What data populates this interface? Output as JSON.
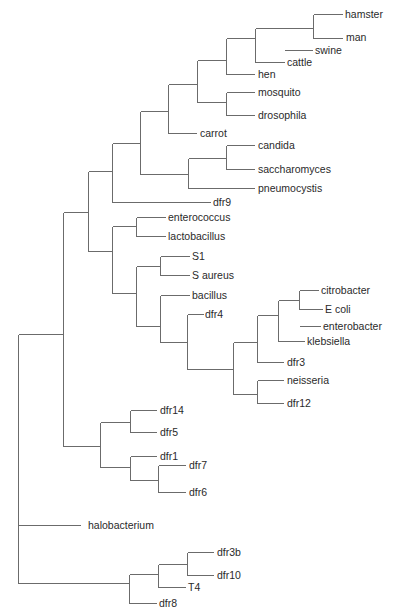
{
  "diagram": {
    "type": "phylogenetic-tree",
    "root_x": 18,
    "branches": [
      {
        "x": 18,
        "y1": 334,
        "y2": 490
      },
      {
        "x": 18,
        "y1": 490,
        "y2": 583
      },
      {
        "x": 63,
        "y1": 212,
        "y2": 446
      },
      {
        "x": 88,
        "y1": 171,
        "y2": 251
      },
      {
        "x": 112,
        "y1": 143,
        "y2": 202
      },
      {
        "x": 140,
        "y1": 111,
        "y2": 174
      },
      {
        "x": 168,
        "y1": 84,
        "y2": 133
      },
      {
        "x": 197,
        "y1": 60,
        "y2": 102
      },
      {
        "x": 226,
        "y1": 38,
        "y2": 74
      },
      {
        "x": 255,
        "y1": 28,
        "y2": 62
      },
      {
        "x": 313,
        "y1": 14,
        "y2": 38
      },
      {
        "x": 226,
        "y1": 92,
        "y2": 115
      },
      {
        "x": 188,
        "y1": 158,
        "y2": 188
      },
      {
        "x": 226,
        "y1": 145,
        "y2": 169
      },
      {
        "x": 112,
        "y1": 226,
        "y2": 293
      },
      {
        "x": 136,
        "y1": 217,
        "y2": 236
      },
      {
        "x": 136,
        "y1": 266,
        "y2": 326
      },
      {
        "x": 160,
        "y1": 256,
        "y2": 275
      },
      {
        "x": 160,
        "y1": 295,
        "y2": 342
      },
      {
        "x": 187,
        "y1": 314,
        "y2": 369
      },
      {
        "x": 233,
        "y1": 342,
        "y2": 394
      },
      {
        "x": 257,
        "y1": 315,
        "y2": 362
      },
      {
        "x": 278,
        "y1": 300,
        "y2": 341
      },
      {
        "x": 299,
        "y1": 290,
        "y2": 309
      },
      {
        "x": 257,
        "y1": 380,
        "y2": 403
      },
      {
        "x": 100,
        "y1": 422,
        "y2": 467
      },
      {
        "x": 130,
        "y1": 410,
        "y2": 432
      },
      {
        "x": 130,
        "y1": 456,
        "y2": 480
      },
      {
        "x": 158,
        "y1": 465,
        "y2": 492
      },
      {
        "x": 129,
        "y1": 574,
        "y2": 603
      },
      {
        "x": 158,
        "y1": 564,
        "y2": 587
      },
      {
        "x": 187,
        "y1": 552,
        "y2": 575
      }
    ],
    "horizontals": [
      {
        "y": 334,
        "x1": 18,
        "x2": 63
      },
      {
        "y": 525,
        "x1": 18,
        "x2": 80
      },
      {
        "y": 583,
        "x1": 18,
        "x2": 129
      },
      {
        "y": 212,
        "x1": 63,
        "x2": 88
      },
      {
        "y": 446,
        "x1": 63,
        "x2": 100
      },
      {
        "y": 171,
        "x1": 88,
        "x2": 112
      },
      {
        "y": 251,
        "x1": 88,
        "x2": 112
      },
      {
        "y": 143,
        "x1": 112,
        "x2": 140
      },
      {
        "y": 202,
        "x1": 112,
        "x2": 210
      },
      {
        "y": 111,
        "x1": 140,
        "x2": 168
      },
      {
        "y": 174,
        "x1": 140,
        "x2": 188
      },
      {
        "y": 84,
        "x1": 168,
        "x2": 197
      },
      {
        "y": 133,
        "x1": 168,
        "x2": 196
      },
      {
        "y": 60,
        "x1": 197,
        "x2": 226
      },
      {
        "y": 102,
        "x1": 197,
        "x2": 226
      },
      {
        "y": 38,
        "x1": 226,
        "x2": 255
      },
      {
        "y": 74,
        "x1": 226,
        "x2": 254
      },
      {
        "y": 28,
        "x1": 255,
        "x2": 313
      },
      {
        "y": 62,
        "x1": 255,
        "x2": 284
      },
      {
        "y": 14,
        "x1": 313,
        "x2": 342
      },
      {
        "y": 38,
        "x1": 313,
        "x2": 342
      },
      {
        "y": 50,
        "x1": 284,
        "x2": 312
      },
      {
        "y": 92,
        "x1": 226,
        "x2": 254
      },
      {
        "y": 115,
        "x1": 226,
        "x2": 254
      },
      {
        "y": 158,
        "x1": 188,
        "x2": 226
      },
      {
        "y": 188,
        "x1": 188,
        "x2": 254
      },
      {
        "y": 145,
        "x1": 226,
        "x2": 254
      },
      {
        "y": 169,
        "x1": 226,
        "x2": 254
      },
      {
        "y": 226,
        "x1": 112,
        "x2": 136
      },
      {
        "y": 293,
        "x1": 112,
        "x2": 136
      },
      {
        "y": 217,
        "x1": 136,
        "x2": 165
      },
      {
        "y": 236,
        "x1": 136,
        "x2": 165
      },
      {
        "y": 266,
        "x1": 136,
        "x2": 160
      },
      {
        "y": 326,
        "x1": 136,
        "x2": 160
      },
      {
        "y": 256,
        "x1": 160,
        "x2": 189
      },
      {
        "y": 275,
        "x1": 160,
        "x2": 189
      },
      {
        "y": 295,
        "x1": 160,
        "x2": 189
      },
      {
        "y": 342,
        "x1": 160,
        "x2": 187
      },
      {
        "y": 314,
        "x1": 187,
        "x2": 203
      },
      {
        "y": 369,
        "x1": 187,
        "x2": 233
      },
      {
        "y": 342,
        "x1": 233,
        "x2": 257
      },
      {
        "y": 394,
        "x1": 233,
        "x2": 257
      },
      {
        "y": 315,
        "x1": 257,
        "x2": 278
      },
      {
        "y": 362,
        "x1": 257,
        "x2": 283
      },
      {
        "y": 300,
        "x1": 278,
        "x2": 299
      },
      {
        "y": 341,
        "x1": 278,
        "x2": 304
      },
      {
        "y": 326,
        "x1": 299,
        "x2": 320
      },
      {
        "y": 290,
        "x1": 299,
        "x2": 318
      },
      {
        "y": 309,
        "x1": 299,
        "x2": 322
      },
      {
        "y": 380,
        "x1": 257,
        "x2": 283
      },
      {
        "y": 403,
        "x1": 257,
        "x2": 283
      },
      {
        "y": 422,
        "x1": 100,
        "x2": 130
      },
      {
        "y": 467,
        "x1": 100,
        "x2": 130
      },
      {
        "y": 410,
        "x1": 130,
        "x2": 156
      },
      {
        "y": 432,
        "x1": 130,
        "x2": 156
      },
      {
        "y": 456,
        "x1": 130,
        "x2": 156
      },
      {
        "y": 480,
        "x1": 130,
        "x2": 158
      },
      {
        "y": 465,
        "x1": 158,
        "x2": 185
      },
      {
        "y": 492,
        "x1": 158,
        "x2": 185
      },
      {
        "y": 574,
        "x1": 129,
        "x2": 158
      },
      {
        "y": 603,
        "x1": 129,
        "x2": 156
      },
      {
        "y": 564,
        "x1": 158,
        "x2": 187
      },
      {
        "y": 587,
        "x1": 158,
        "x2": 185
      },
      {
        "y": 552,
        "x1": 187,
        "x2": 213
      },
      {
        "y": 575,
        "x1": 187,
        "x2": 213
      }
    ],
    "leaves": [
      {
        "label": "hamster",
        "x": 345,
        "y": 14
      },
      {
        "label": "man",
        "x": 346,
        "y": 37
      },
      {
        "label": "swine",
        "x": 315,
        "y": 50
      },
      {
        "label": "cattle",
        "x": 287,
        "y": 62
      },
      {
        "label": "hen",
        "x": 258,
        "y": 74
      },
      {
        "label": "mosquito",
        "x": 258,
        "y": 92
      },
      {
        "label": "drosophila",
        "x": 258,
        "y": 115
      },
      {
        "label": "carrot",
        "x": 200,
        "y": 133
      },
      {
        "label": "candida",
        "x": 258,
        "y": 145
      },
      {
        "label": "saccharomyces",
        "x": 258,
        "y": 169
      },
      {
        "label": "pneumocystis",
        "x": 258,
        "y": 188
      },
      {
        "label": "dfr9",
        "x": 213,
        "y": 202
      },
      {
        "label": "enterococcus",
        "x": 168,
        "y": 217
      },
      {
        "label": "lactobacillus",
        "x": 168,
        "y": 236
      },
      {
        "label": "S1",
        "x": 192,
        "y": 256
      },
      {
        "label": "S aureus",
        "x": 192,
        "y": 275
      },
      {
        "label": "bacillus",
        "x": 192,
        "y": 295
      },
      {
        "label": "dfr4",
        "x": 205,
        "y": 314
      },
      {
        "label": "citrobacter",
        "x": 321,
        "y": 290
      },
      {
        "label": "E coli",
        "x": 325,
        "y": 309
      },
      {
        "label": "enterobacter",
        "x": 323,
        "y": 326
      },
      {
        "label": "klebsiella",
        "x": 307,
        "y": 341
      },
      {
        "label": "dfr3",
        "x": 287,
        "y": 362
      },
      {
        "label": "neisseria",
        "x": 287,
        "y": 380
      },
      {
        "label": "dfr12",
        "x": 287,
        "y": 403
      },
      {
        "label": "dfr14",
        "x": 160,
        "y": 410
      },
      {
        "label": "dfr5",
        "x": 160,
        "y": 432
      },
      {
        "label": "dfr1",
        "x": 160,
        "y": 456
      },
      {
        "label": "dfr7",
        "x": 189,
        "y": 465
      },
      {
        "label": "dfr6",
        "x": 189,
        "y": 492
      },
      {
        "label": "halobacterium",
        "x": 88,
        "y": 525
      },
      {
        "label": "dfr3b",
        "x": 217,
        "y": 552
      },
      {
        "label": "dfr10",
        "x": 217,
        "y": 575
      },
      {
        "label": "T4",
        "x": 188,
        "y": 587
      },
      {
        "label": "dfr8",
        "x": 159,
        "y": 603
      }
    ]
  },
  "colors": {
    "branch": "#6b6b6b",
    "label": "#2a2a2a",
    "background": "#ffffff"
  }
}
